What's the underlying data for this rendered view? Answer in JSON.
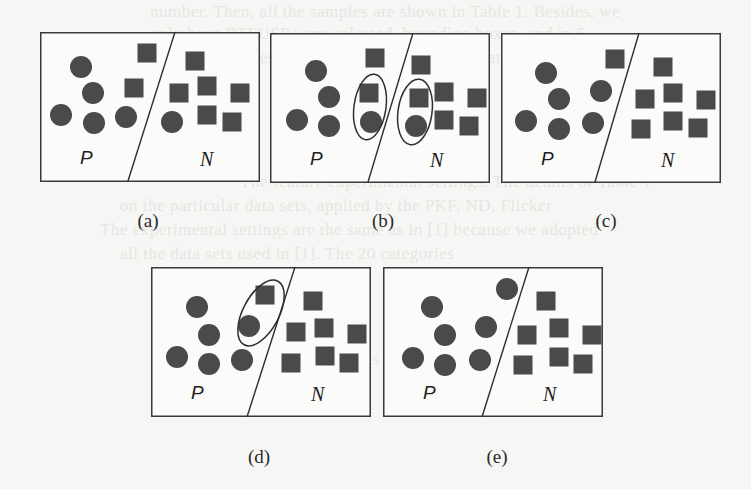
{
  "figure": {
    "colors": {
      "shape_fill": "#4a4a4a",
      "outline": "#3a3a3a",
      "background": "#f6f6f4"
    },
    "class_labels": {
      "positive": "P",
      "negative": "N"
    },
    "panels": [
      {
        "id": "a",
        "caption": "(a)",
        "line": [
          135,
          0,
          88,
          149
        ],
        "circles": [
          [
            41,
            35
          ],
          [
            53,
            61
          ],
          [
            21,
            83
          ],
          [
            54,
            91
          ],
          [
            86,
            85
          ],
          [
            132,
            90
          ]
        ],
        "squares": [
          [
            107,
            21
          ],
          [
            94,
            56
          ],
          [
            155,
            29
          ],
          [
            139,
            61
          ],
          [
            167,
            54
          ],
          [
            200,
            61
          ],
          [
            167,
            83
          ],
          [
            192,
            90
          ]
        ],
        "ellipses": []
      },
      {
        "id": "b",
        "caption": "(b)",
        "line": [
          143,
          0,
          98,
          149
        ],
        "circles": [
          [
            46,
            38
          ],
          [
            59,
            64
          ],
          [
            27,
            87
          ],
          [
            59,
            93
          ],
          [
            101,
            89
          ],
          [
            146,
            93
          ]
        ],
        "squares": [
          [
            105,
            25
          ],
          [
            99,
            60
          ],
          [
            151,
            32
          ],
          [
            149,
            65
          ],
          [
            174,
            59
          ],
          [
            207,
            65
          ],
          [
            174,
            87
          ],
          [
            199,
            93
          ]
        ],
        "ellipses": [
          [
            100,
            74,
            16,
            33,
            8
          ],
          [
            145,
            79,
            17,
            33,
            8
          ]
        ]
      },
      {
        "id": "c",
        "caption": "(c)",
        "line": [
          138,
          0,
          94,
          149
        ],
        "circles": [
          [
            45,
            40
          ],
          [
            58,
            66
          ],
          [
            25,
            88
          ],
          [
            58,
            96
          ],
          [
            100,
            58
          ],
          [
            92,
            90
          ]
        ],
        "squares": [
          [
            114,
            26
          ],
          [
            162,
            34
          ],
          [
            144,
            66
          ],
          [
            172,
            60
          ],
          [
            205,
            67
          ],
          [
            140,
            96
          ],
          [
            172,
            88
          ],
          [
            197,
            95
          ]
        ],
        "ellipses": []
      },
      {
        "id": "d",
        "caption": "(d)",
        "line": [
          144,
          0,
          96,
          150
        ],
        "circles": [
          [
            46,
            40
          ],
          [
            58,
            68
          ],
          [
            26,
            90
          ],
          [
            58,
            97
          ],
          [
            91,
            93
          ],
          [
            98,
            59
          ]
        ],
        "squares": [
          [
            114,
            28
          ],
          [
            162,
            34
          ],
          [
            145,
            65
          ],
          [
            173,
            61
          ],
          [
            206,
            67
          ],
          [
            140,
            96
          ],
          [
            174,
            89
          ],
          [
            198,
            96
          ]
        ],
        "ellipses": [
          [
            110,
            46,
            18,
            36,
            28
          ]
        ]
      },
      {
        "id": "e",
        "caption": "(e)",
        "line": [
          146,
          0,
          99,
          150
        ],
        "circles": [
          [
            49,
            40
          ],
          [
            62,
            68
          ],
          [
            30,
            91
          ],
          [
            62,
            98
          ],
          [
            124,
            22
          ],
          [
            103,
            60
          ],
          [
            97,
            93
          ]
        ],
        "squares": [
          [
            163,
            34
          ],
          [
            144,
            68
          ],
          [
            176,
            61
          ],
          [
            209,
            68
          ],
          [
            140,
            98
          ],
          [
            176,
            90
          ],
          [
            200,
            97
          ]
        ],
        "ellipses": []
      }
    ]
  },
  "bleed_text": [
    "number. Then, all the samples are shown in Table 1. Besides, we",
    "only have RTFUSP were selected, bounding boxes, and in 5",
    "ground-truth samples that are selected in the evaluation data set",
    "The feature experimental settings. The details of Table 1",
    "on the particular data sets, applied by the PKF, ND, Flicker",
    "The experimental settings are the same as in [1] because we adopted",
    "all the data sets used in [1]. The 20 categories",
    "Table 1: Statistics on the evaluation datasets"
  ]
}
